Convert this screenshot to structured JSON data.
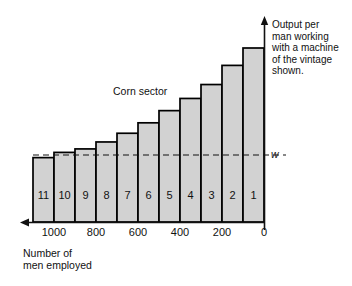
{
  "chart_data": {
    "type": "bar",
    "title": "",
    "subtitle": "",
    "series_label": "Corn sector",
    "xlabel": "Number of\nmen employed",
    "ylabel": "Output per\nman working\nwith a machine\nof the vintage\nshown.",
    "x_tick_labels": [
      "1000",
      "800",
      "600",
      "400",
      "200",
      "0"
    ],
    "x_tick_values": [
      1000,
      800,
      600,
      400,
      200,
      0
    ],
    "x_axis_direction": "decreasing-left-to-right",
    "xlim": [
      1100,
      0
    ],
    "ylim": [
      0,
      1.0
    ],
    "grid": false,
    "legend_position": "none",
    "bar_fill_color": "#d2d2d2",
    "bar_edge_color": "#000000",
    "categories": [
      "11",
      "10",
      "9",
      "8",
      "7",
      "6",
      "5",
      "4",
      "3",
      "2",
      "1"
    ],
    "bar_labels": [
      "11",
      "10",
      "9",
      "8",
      "7",
      "6",
      "5",
      "4",
      "3",
      "2",
      "1"
    ],
    "values": [
      0.37,
      0.4,
      0.42,
      0.46,
      0.51,
      0.57,
      0.64,
      0.71,
      0.79,
      0.9,
      1.0
    ],
    "bar_widths_men": [
      100,
      100,
      100,
      100,
      100,
      100,
      100,
      100,
      100,
      100,
      100
    ],
    "annotations": [
      {
        "name": "wage-line",
        "label": "w",
        "type": "horizontal-dashed-line",
        "value": 0.385
      }
    ]
  },
  "axes": {
    "y_arrow": true,
    "x_arrow": true
  }
}
